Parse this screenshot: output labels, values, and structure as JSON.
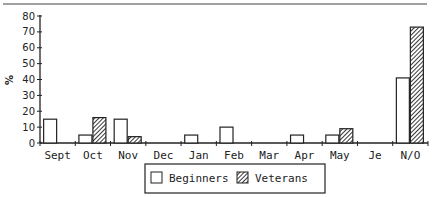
{
  "chart_data": {
    "type": "bar",
    "title": "",
    "xlabel": "",
    "ylabel": "%",
    "ylim": [
      0,
      80
    ],
    "yticks": [
      0,
      10,
      20,
      30,
      40,
      50,
      60,
      70,
      80
    ],
    "grid": false,
    "categories": [
      "Sept",
      "Oct",
      "Nov",
      "Dec",
      "Jan",
      "Feb",
      "Mar",
      "Apr",
      "May",
      "Je",
      "N/O"
    ],
    "series": [
      {
        "name": "Beginners",
        "pattern": "open",
        "values": [
          15,
          5,
          15,
          0,
          5,
          10,
          0,
          5,
          5,
          0,
          41
        ]
      },
      {
        "name": "Veterans",
        "pattern": "hatched",
        "values": [
          0,
          16,
          4,
          0,
          0,
          0,
          0,
          0,
          9,
          0,
          73
        ]
      }
    ],
    "legend": {
      "position": "bottom-center",
      "entries": [
        "Beginners",
        "Veterans"
      ]
    }
  },
  "colors": {
    "ink": "#222222",
    "background": "#ffffff"
  }
}
